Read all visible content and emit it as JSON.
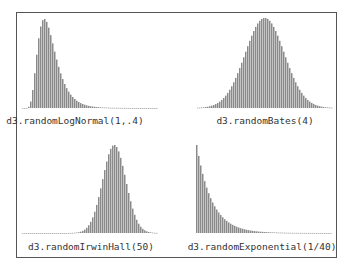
{
  "chart_data": [
    {
      "type": "bar",
      "title": "d3.randomLogNormal(1,.4)",
      "distribution": "lognormal",
      "params": {
        "mu": 1,
        "sigma": 0.4
      },
      "description": "Right-skewed histogram with sharp peak near the left edge and long tail to the right"
    },
    {
      "type": "bar",
      "title": "d3.randomBates(4)",
      "distribution": "bates",
      "params": {
        "n": 4
      },
      "description": "Symmetric bell-shaped histogram centered in the panel"
    },
    {
      "type": "bar",
      "title": "d3.randomIrwinHall(50)",
      "distribution": "irwinhall",
      "params": {
        "n": 50
      },
      "description": "Narrow symmetric peak centered in the panel"
    },
    {
      "type": "bar",
      "title": "d3.randomExponential(1/40)",
      "distribution": "exponential",
      "params": {
        "lambda": 0.025
      },
      "description": "Decaying histogram starting at maximum at the left edge"
    }
  ],
  "colors": {
    "bar": "#8a8a8a",
    "border": "#555555",
    "label": "#333333"
  }
}
